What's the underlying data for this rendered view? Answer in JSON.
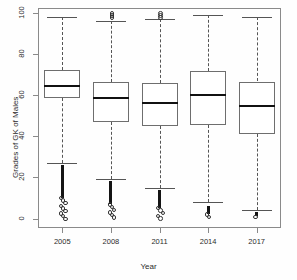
{
  "chart_data": {
    "type": "boxplot",
    "title": "",
    "xlabel": "Year",
    "ylabel": "Grades of GK of Males",
    "categories": [
      "2005",
      "2008",
      "2011",
      "2014",
      "2017"
    ],
    "ylim": [
      0,
      100
    ],
    "yticks": [
      0,
      20,
      40,
      60,
      80,
      100
    ],
    "ytick_labels": [
      "0",
      "20",
      "40",
      "60",
      "80",
      "100"
    ],
    "grid": false,
    "legend": "none",
    "boxes": [
      {
        "category": "2005",
        "whisker_low": 27,
        "q1": 58.5,
        "median": 64.5,
        "q3": 72,
        "whisker_high": 98,
        "outliers_low": [
          26,
          24,
          22,
          20,
          18,
          16,
          14,
          12,
          10,
          9,
          8,
          7,
          6,
          5,
          4,
          3,
          2,
          1,
          0
        ],
        "outliers_high": []
      },
      {
        "category": "2008",
        "whisker_low": 19,
        "q1": 47,
        "median": 58.5,
        "q3": 66.5,
        "whisker_high": 96,
        "outliers_low": [
          18,
          16,
          14,
          12,
          10,
          9,
          8,
          7,
          6,
          5,
          4,
          3,
          2,
          1,
          0
        ],
        "outliers_high": [
          98,
          99,
          100
        ]
      },
      {
        "category": "2011",
        "whisker_low": 15,
        "q1": 45,
        "median": 56,
        "q3": 66,
        "whisker_high": 97,
        "outliers_low": [
          14,
          12,
          10,
          9,
          8,
          7,
          6,
          5,
          4,
          3,
          2,
          1,
          0
        ],
        "outliers_high": [
          98,
          99,
          100
        ]
      },
      {
        "category": "2014",
        "whisker_low": 8,
        "q1": 45.5,
        "median": 60,
        "q3": 71.5,
        "whisker_high": 99,
        "outliers_low": [
          6,
          5,
          4,
          3,
          2,
          1,
          0
        ],
        "outliers_high": []
      },
      {
        "category": "2017",
        "whisker_low": 4,
        "q1": 41,
        "median": 54.5,
        "q3": 66.5,
        "whisker_high": 98,
        "outliers_low": [
          3,
          2,
          1,
          0
        ],
        "outliers_high": []
      }
    ]
  },
  "axes": {
    "y_title": "Grades of GK of Males",
    "x_title": "Year",
    "y_tick_labels": [
      "0",
      "20",
      "40",
      "60",
      "80",
      "100"
    ],
    "x_tick_labels": [
      "2005",
      "2008",
      "2011",
      "2014",
      "2017"
    ]
  },
  "colors": {
    "frame": "#8a8a8a",
    "box_border": "#6e6e6e",
    "median": "#111111",
    "whisker": "#555555",
    "outlier": "#141414",
    "background": "#fefefe",
    "text": "#2b2b2b"
  }
}
